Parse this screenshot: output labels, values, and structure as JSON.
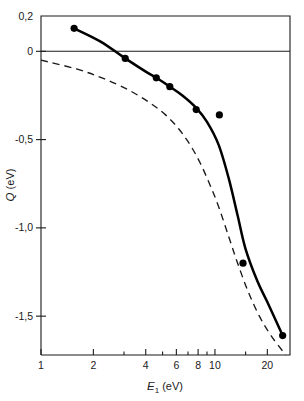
{
  "chart_data": {
    "type": "line",
    "title": "",
    "xlabel": "E1 (eV)",
    "xlabel_symbol": "E",
    "xlabel_subscript": "1",
    "xlabel_unit": "(eV)",
    "ylabel": "Q (eV)",
    "ylabel_symbol": "Q",
    "ylabel_unit": "(eV)",
    "xscale": "log",
    "yscale": "linear",
    "xlim": [
      1,
      27
    ],
    "ylim": [
      -1.72,
      0.2
    ],
    "grid": false,
    "legend": null,
    "x_tick_labels": [
      "1",
      "2",
      "4",
      "6",
      "8",
      "10",
      "20"
    ],
    "x_tick_values": [
      1,
      2,
      4,
      6,
      8,
      10,
      20
    ],
    "x_minor_ticks": [
      3,
      5,
      7,
      9,
      15
    ],
    "y_tick_labels": [
      "0,2",
      "0",
      "-0,5",
      "-1,0",
      "-1,5"
    ],
    "y_tick_values": [
      0.2,
      0,
      -0.5,
      -1.0,
      -1.5
    ],
    "zero_reference_line": 0,
    "series": [
      {
        "name": "measured-points",
        "type": "scatter",
        "marker": "filled-circle",
        "points": [
          {
            "x": 1.55,
            "y": 0.13
          },
          {
            "x": 3.05,
            "y": -0.04
          },
          {
            "x": 4.6,
            "y": -0.15
          },
          {
            "x": 5.5,
            "y": -0.2
          },
          {
            "x": 7.8,
            "y": -0.33
          },
          {
            "x": 10.6,
            "y": -0.36
          },
          {
            "x": 14.5,
            "y": -1.2
          },
          {
            "x": 24.5,
            "y": -1.61
          }
        ]
      },
      {
        "name": "fitted-solid-curve",
        "type": "line",
        "style": "solid",
        "points": [
          {
            "x": 1.55,
            "y": 0.13
          },
          {
            "x": 2.2,
            "y": 0.055
          },
          {
            "x": 3.05,
            "y": -0.04
          },
          {
            "x": 4.0,
            "y": -0.115
          },
          {
            "x": 4.6,
            "y": -0.15
          },
          {
            "x": 5.5,
            "y": -0.2
          },
          {
            "x": 6.5,
            "y": -0.25
          },
          {
            "x": 7.8,
            "y": -0.32
          },
          {
            "x": 9.0,
            "y": -0.4
          },
          {
            "x": 10.5,
            "y": -0.53
          },
          {
            "x": 12.0,
            "y": -0.72
          },
          {
            "x": 13.5,
            "y": -0.93
          },
          {
            "x": 15.0,
            "y": -1.12
          },
          {
            "x": 17.5,
            "y": -1.3
          },
          {
            "x": 20.0,
            "y": -1.42
          },
          {
            "x": 24.5,
            "y": -1.61
          }
        ]
      },
      {
        "name": "theoretical-dashed-curve",
        "type": "line",
        "style": "dashed",
        "points": [
          {
            "x": 1.0,
            "y": -0.05
          },
          {
            "x": 1.6,
            "y": -0.1
          },
          {
            "x": 2.3,
            "y": -0.155
          },
          {
            "x": 3.2,
            "y": -0.22
          },
          {
            "x": 4.2,
            "y": -0.29
          },
          {
            "x": 5.2,
            "y": -0.36
          },
          {
            "x": 6.2,
            "y": -0.44
          },
          {
            "x": 7.2,
            "y": -0.53
          },
          {
            "x": 8.2,
            "y": -0.63
          },
          {
            "x": 9.3,
            "y": -0.75
          },
          {
            "x": 10.5,
            "y": -0.88
          },
          {
            "x": 12.0,
            "y": -1.05
          },
          {
            "x": 13.5,
            "y": -1.2
          },
          {
            "x": 15.5,
            "y": -1.36
          },
          {
            "x": 18.0,
            "y": -1.5
          },
          {
            "x": 21.0,
            "y": -1.61
          },
          {
            "x": 25.5,
            "y": -1.72
          }
        ]
      }
    ]
  },
  "colors": {
    "axis": "#1a1a1a",
    "solid_curve": "#000000",
    "dashed_curve": "#1a1a1a",
    "marker": "#000000",
    "background": "#ffffff"
  }
}
